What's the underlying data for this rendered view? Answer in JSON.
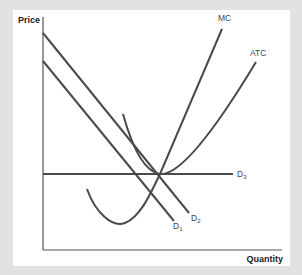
{
  "diagram": {
    "type": "economics-cost-curves",
    "axes": {
      "y_label": "Price",
      "x_label": "Quantity"
    },
    "curves": [
      {
        "name": "MC",
        "label": "MC",
        "kind": "marginal-cost"
      },
      {
        "name": "ATC",
        "label": "ATC",
        "kind": "average-total-cost"
      },
      {
        "name": "D1",
        "label_main": "D",
        "label_sub": "1",
        "kind": "demand"
      },
      {
        "name": "D2",
        "label_main": "D",
        "label_sub": "2",
        "kind": "demand"
      },
      {
        "name": "D3",
        "label_main": "D",
        "label_sub": "3",
        "kind": "demand-horizontal"
      }
    ],
    "colors": {
      "background": "#e2e2e2",
      "panel": "#ffffff",
      "line": "#4a4a4a",
      "axis": "#555555"
    }
  }
}
